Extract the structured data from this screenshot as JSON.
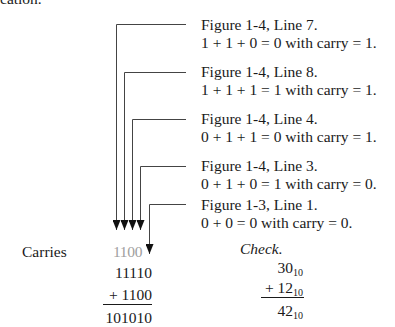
{
  "top_fragment": "cation.",
  "annotations": [
    {
      "ref": "Figure 1-4, Line 7.",
      "eq": "1 + 1 + 0 = 0 with carry = 1."
    },
    {
      "ref": "Figure 1-4, Line 8.",
      "eq": "1 + 1 + 1 = 1 with carry = 1."
    },
    {
      "ref": "Figure 1-4, Line 4.",
      "eq": "0 + 1 + 1 = 0 with carry = 1."
    },
    {
      "ref": "Figure 1-4, Line 3.",
      "eq": "0 + 1 + 0 = 1 with carry = 0."
    },
    {
      "ref": "Figure 1-3, Line 1.",
      "eq": "0 + 0 = 0 with carry = 0."
    }
  ],
  "binary_sum": {
    "carries_label": "Carries",
    "carries": "1100",
    "addend1": "11110",
    "addend2": "+ 1100",
    "result": "101010"
  },
  "check": {
    "label": "Check.",
    "a": "30",
    "b": "+ 12",
    "sum": "42",
    "base": "10"
  },
  "colors": {
    "text": "#1a1a1a",
    "carry_gray": "#a0a0a0",
    "line": "#333333"
  }
}
